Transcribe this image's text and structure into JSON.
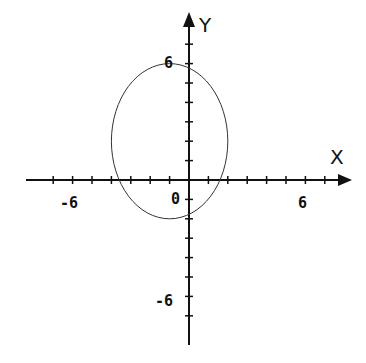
{
  "chart_data": {
    "type": "line",
    "title": "",
    "xlabel": "X",
    "ylabel": "Y",
    "xlim": [
      -8,
      8
    ],
    "ylim": [
      -8,
      8
    ],
    "grid": false,
    "origin_label": "0",
    "x_tick_labels": [
      {
        "value": -6,
        "label": "-6"
      },
      {
        "value": 6,
        "label": "6"
      }
    ],
    "y_tick_labels": [
      {
        "value": 6,
        "label": "6"
      },
      {
        "value": -6,
        "label": "-6"
      }
    ],
    "tick_step": 1,
    "series": [
      {
        "name": "ellipse",
        "shape": "ellipse",
        "center": [
          -1,
          2
        ],
        "semi_axis_x": 3,
        "semi_axis_y": 4
      }
    ]
  },
  "labels": {
    "x_axis": "X",
    "y_axis": "Y",
    "origin": "0",
    "x_neg6": "-6",
    "x_pos6": "6",
    "y_pos6": "6",
    "y_neg6": "-6"
  }
}
